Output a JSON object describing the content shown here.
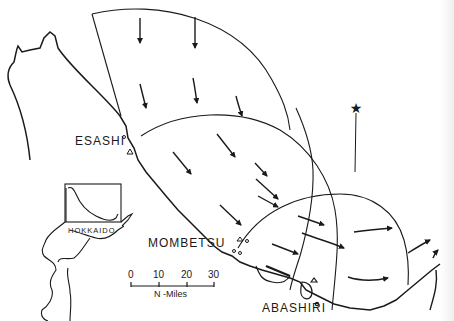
{
  "map": {
    "title": "",
    "stations": [
      {
        "name": "ESASHI",
        "label": "ESASHI"
      },
      {
        "name": "MOMBETSU",
        "label": "MOMBETSU"
      },
      {
        "name": "ABASHIRI",
        "label": "ABASHIRI"
      }
    ],
    "inset": {
      "label": "HOKKAIDO"
    },
    "scale_bar": {
      "ticks": [
        "0",
        "10",
        "20",
        "30"
      ],
      "unit": "N -Miles"
    },
    "north_arrow": {
      "symbol": "★"
    },
    "colors": {
      "ink": "#1a1a1a",
      "background": "#ffffff"
    }
  }
}
